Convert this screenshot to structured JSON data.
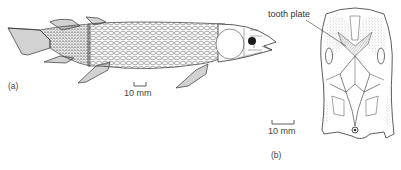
{
  "figure": {
    "panel_a": {
      "label": "(a)",
      "subject": "lobe-finned fish, lateral view",
      "scale_bar": "10 mm"
    },
    "panel_b": {
      "label": "(b)",
      "subject": "skull, palatal view",
      "scale_bar": "10 mm",
      "annotation": "tooth plate"
    }
  },
  "colors": {
    "ink": "#2a2a2a",
    "fin_shade": "#9a9a9a",
    "eye": "#1a1a1a",
    "stipple": "#777777"
  }
}
